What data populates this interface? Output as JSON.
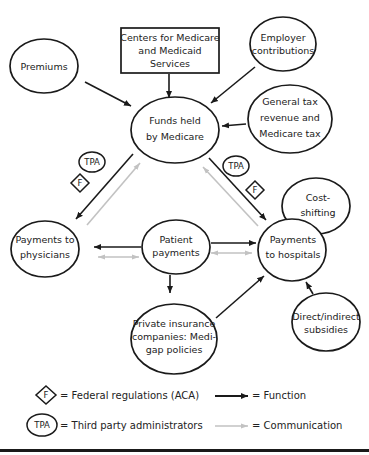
{
  "diagram": {
    "nodes": [
      {
        "id": "premiums",
        "lines": [
          "Premiums"
        ]
      },
      {
        "id": "cms",
        "lines": [
          "Centers for Medicare",
          "and Medicaid",
          "Services"
        ]
      },
      {
        "id": "employer",
        "lines": [
          "Employer",
          "contributions"
        ]
      },
      {
        "id": "funds",
        "lines": [
          "Funds held",
          "by Medicare"
        ]
      },
      {
        "id": "general_tax",
        "lines": [
          "General tax",
          "revenue and",
          "Medicare tax"
        ]
      },
      {
        "id": "physicians",
        "lines": [
          "Payments to",
          "physicians"
        ]
      },
      {
        "id": "patient",
        "lines": [
          "Patient",
          "payments"
        ]
      },
      {
        "id": "hospitals",
        "lines": [
          "Payments",
          "to hospitals"
        ]
      },
      {
        "id": "cost_shifting",
        "lines": [
          "Cost-",
          "shifting"
        ]
      },
      {
        "id": "subsidies",
        "lines": [
          "Direct/indirect",
          "subsidies"
        ]
      },
      {
        "id": "private_ins",
        "lines": [
          "Private insurance",
          "companies: Medi-",
          "gap policies"
        ]
      }
    ],
    "markers": {
      "tpa": "TPA",
      "f": "F"
    },
    "edges": [
      {
        "from": "premiums",
        "to": "funds",
        "type": "function"
      },
      {
        "from": "cms",
        "to": "funds",
        "type": "function"
      },
      {
        "from": "employer",
        "to": "funds",
        "type": "function"
      },
      {
        "from": "general_tax",
        "to": "funds",
        "type": "function"
      },
      {
        "from": "funds",
        "to": "physicians",
        "type": "function"
      },
      {
        "from": "physicians",
        "to": "funds",
        "type": "communication"
      },
      {
        "from": "funds",
        "to": "hospitals",
        "type": "function"
      },
      {
        "from": "hospitals",
        "to": "funds",
        "type": "communication"
      },
      {
        "from": "patient",
        "to": "physicians",
        "type": "function"
      },
      {
        "from": "physicians",
        "to": "patient",
        "type": "communication",
        "bidirectional": true
      },
      {
        "from": "patient",
        "to": "hospitals",
        "type": "function"
      },
      {
        "from": "hospitals",
        "to": "patient",
        "type": "communication",
        "bidirectional": true
      },
      {
        "from": "patient",
        "to": "private_ins",
        "type": "function"
      },
      {
        "from": "private_ins",
        "to": "hospitals",
        "type": "function"
      },
      {
        "from": "subsidies",
        "to": "hospitals",
        "type": "function"
      }
    ]
  },
  "legend": {
    "f_symbol": "F",
    "f_label": "= Federal regulations (ACA)",
    "tpa_symbol": "TPA",
    "tpa_label": "= Third party administrators",
    "function_label": "= Function",
    "communication_label": "= Communication"
  },
  "colors": {
    "function": "#1a1a1a",
    "communication": "#bdbdbd",
    "stroke": "#1a1a1a"
  }
}
